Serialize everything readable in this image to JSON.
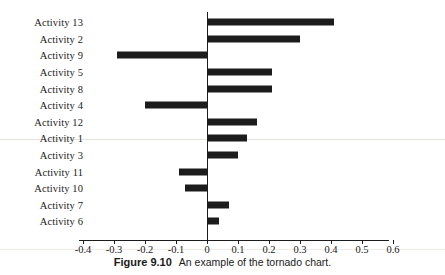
{
  "figure": {
    "caption_label": "Figure 9.10",
    "caption_text": "An example of the tornado chart."
  },
  "chart_data": {
    "type": "bar",
    "orientation": "horizontal",
    "variant": "tornado",
    "title": "",
    "subtitle": "",
    "xlabel": "",
    "ylabel": "",
    "categories": [
      "Activity 13",
      "Activity 2",
      "Activity 9",
      "Activity 5",
      "Activity 8",
      "Activity 4",
      "Activity 12",
      "Activity 1",
      "Activity 3",
      "Activity 11",
      "Activity 10",
      "Activity 7",
      "Activity 6"
    ],
    "values": [
      0.41,
      0.3,
      -0.29,
      0.21,
      0.21,
      -0.2,
      0.16,
      0.13,
      0.1,
      -0.09,
      -0.07,
      0.07,
      0.04
    ],
    "xlim": [
      -0.4,
      0.68
    ],
    "xticks": [
      -0.4,
      -0.3,
      -0.2,
      -0.1,
      0,
      0.1,
      0.2,
      0.3,
      0.4,
      0.5,
      0.6
    ],
    "xticklabels": [
      "-0.4",
      "-0.3",
      "-0.2",
      "-0.1",
      "0",
      "0.1",
      "0.2",
      "0.3",
      "0.4",
      "0.5",
      "0.6"
    ],
    "grid": false,
    "legend": null,
    "bar_color": "#1c1c1c",
    "axis_color": "#1c1c1c"
  }
}
